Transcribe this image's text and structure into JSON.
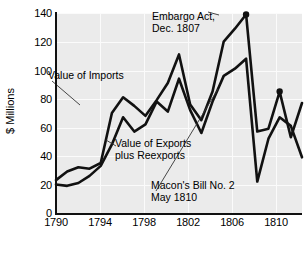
{
  "chart_data": {
    "type": "line",
    "title": "",
    "xlabel": "",
    "ylabel": "$ Millions",
    "xlim": [
      1790,
      1812
    ],
    "ylim": [
      0,
      140
    ],
    "grid": true,
    "legend": "annotations",
    "x_ticks": [
      "1790",
      "1794",
      "1798",
      "1802",
      "1806",
      "1810"
    ],
    "x_tick_values": [
      1790,
      1794,
      1798,
      1802,
      1806,
      1810
    ],
    "y_ticks": [
      "0",
      "20",
      "40",
      "60",
      "80",
      "100",
      "120",
      "140"
    ],
    "y_tick_values": [
      0,
      20,
      40,
      60,
      80,
      100,
      120,
      140
    ],
    "x": [
      1790,
      1791,
      1792,
      1793,
      1794,
      1795,
      1796,
      1797,
      1798,
      1799,
      1800,
      1801,
      1802,
      1803,
      1804,
      1805,
      1806,
      1807,
      1808,
      1809,
      1810,
      1811,
      1812
    ],
    "series": [
      {
        "name": "Value of Imports",
        "values": [
          23,
          29,
          32,
          31,
          35,
          70,
          81,
          75,
          68,
          79,
          91,
          111,
          76,
          65,
          85,
          120,
          129,
          139,
          57,
          59,
          85,
          53,
          77
        ]
      },
      {
        "name": "Value of Exports plus Reexports",
        "values": [
          20,
          19,
          21,
          26,
          33,
          48,
          67,
          57,
          62,
          78,
          71,
          94,
          72,
          56,
          78,
          96,
          101,
          108,
          22,
          52,
          67,
          61,
          39
        ]
      }
    ],
    "annotations": [
      {
        "id": "imports",
        "text": "Value of Imports",
        "lines": [
          "Value of Imports"
        ],
        "points_to": {
          "x": 1794.6,
          "y": 73
        }
      },
      {
        "id": "embargo",
        "text": "Embargo Act, Dec. 1807",
        "lines": [
          "Embargo Act,",
          "Dec. 1807"
        ],
        "points_to": {
          "x": 1807,
          "y": 139
        }
      },
      {
        "id": "exports",
        "text": "Value of Exports plus Reexports",
        "lines": [
          "Value of Exports",
          "plus Reexports"
        ],
        "points_to": {
          "x": 1802.3,
          "y": 72
        }
      },
      {
        "id": "macons",
        "text": "Macon's Bill No. 2 May 1810",
        "lines": [
          "Macon's Bill No. 2",
          "May 1810"
        ],
        "points_to": {
          "x": 1810,
          "y": 85
        }
      }
    ],
    "marker_points": [
      {
        "x": 1807,
        "y": 139,
        "label": "Embargo Act, Dec. 1807"
      },
      {
        "x": 1810,
        "y": 85,
        "label": "Macon's Bill No. 2 May 1810"
      }
    ],
    "colors": {
      "plot_background": "#ebebeb",
      "gridline": "#fbfbfb",
      "line": "#111111",
      "axis": "#111111",
      "text": "#000000",
      "page_background": "#ffffff"
    }
  },
  "annotations": {
    "imports_line1": "Value of Imports",
    "embargo_line1": "Embargo Act,",
    "embargo_line2": "Dec. 1807",
    "exports_line1": "Value of Exports",
    "exports_line2": "plus Reexports",
    "macons_line1": "Macon's Bill No. 2",
    "macons_line2": "May 1810"
  },
  "axes": {
    "y_title": "$ Millions",
    "y_labels": [
      "140",
      "120",
      "100",
      "80",
      "60",
      "40",
      "20",
      "0"
    ],
    "x_labels": [
      "1790",
      "1794",
      "1798",
      "1802",
      "1806",
      "1810"
    ]
  }
}
